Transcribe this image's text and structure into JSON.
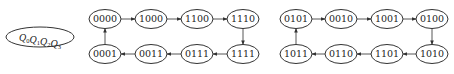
{
  "legend": {
    "label": "Q0Q1Q2Q3",
    "parts": [
      {
        "base": "Q",
        "sub": "0"
      },
      {
        "base": "Q",
        "sub": "1"
      },
      {
        "base": "Q",
        "sub": "2"
      },
      {
        "base": "Q",
        "sub": "3"
      }
    ]
  },
  "cycles": [
    {
      "name": "valid-cycle",
      "states": [
        "0000",
        "1000",
        "1100",
        "1110",
        "1111",
        "0111",
        "0011",
        "0001"
      ]
    },
    {
      "name": "invalid-cycle",
      "states": [
        "0101",
        "0010",
        "1001",
        "0100",
        "1010",
        "1101",
        "0110",
        "1011"
      ]
    }
  ],
  "nodes": [
    {
      "id": "n0000",
      "label": "0000",
      "x": 105,
      "y": 19
    },
    {
      "id": "n1000",
      "label": "1000",
      "x": 151,
      "y": 19
    },
    {
      "id": "n1100",
      "label": "1100",
      "x": 197,
      "y": 19
    },
    {
      "id": "n1110",
      "label": "1110",
      "x": 243,
      "y": 19
    },
    {
      "id": "n1111",
      "label": "1111",
      "x": 243,
      "y": 54
    },
    {
      "id": "n0111",
      "label": "0111",
      "x": 197,
      "y": 54
    },
    {
      "id": "n0011",
      "label": "0011",
      "x": 151,
      "y": 54
    },
    {
      "id": "n0001",
      "label": "0001",
      "x": 105,
      "y": 54
    },
    {
      "id": "n0101",
      "label": "0101",
      "x": 296,
      "y": 19
    },
    {
      "id": "n0010",
      "label": "0010",
      "x": 341,
      "y": 19
    },
    {
      "id": "n1001",
      "label": "1001",
      "x": 387,
      "y": 19
    },
    {
      "id": "n0100",
      "label": "0100",
      "x": 432,
      "y": 19
    },
    {
      "id": "n1010",
      "label": "1010",
      "x": 432,
      "y": 54
    },
    {
      "id": "n1101",
      "label": "1101",
      "x": 387,
      "y": 54
    },
    {
      "id": "n0110",
      "label": "0110",
      "x": 341,
      "y": 54
    },
    {
      "id": "n1011",
      "label": "1011",
      "x": 296,
      "y": 54
    }
  ],
  "edges": [
    [
      "n0000",
      "n1000"
    ],
    [
      "n1000",
      "n1100"
    ],
    [
      "n1100",
      "n1110"
    ],
    [
      "n1110",
      "n1111"
    ],
    [
      "n1111",
      "n0111"
    ],
    [
      "n0111",
      "n0011"
    ],
    [
      "n0011",
      "n0001"
    ],
    [
      "n0001",
      "n0000"
    ],
    [
      "n0101",
      "n0010"
    ],
    [
      "n0010",
      "n1001"
    ],
    [
      "n1001",
      "n0100"
    ],
    [
      "n0100",
      "n1010"
    ],
    [
      "n1010",
      "n1101"
    ],
    [
      "n1101",
      "n0110"
    ],
    [
      "n0110",
      "n1011"
    ],
    [
      "n1011",
      "n0101"
    ]
  ],
  "style": {
    "stroke": "#333333",
    "background": "#ffffff",
    "node_rx": 16,
    "node_ry": 9.5
  }
}
